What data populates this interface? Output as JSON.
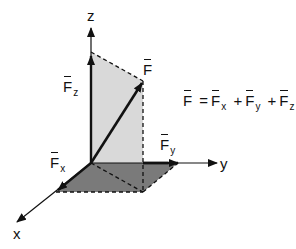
{
  "diagram": {
    "axes": {
      "x": "x",
      "y": "y",
      "z": "z"
    },
    "vectors": {
      "F": {
        "symbol": "F",
        "subscript": ""
      },
      "Fx": {
        "symbol": "F",
        "subscript": "x"
      },
      "Fy": {
        "symbol": "F",
        "subscript": "y"
      },
      "Fz": {
        "symbol": "F",
        "subscript": "z"
      }
    },
    "equation": {
      "lhs": "F",
      "equals": "=",
      "terms": [
        {
          "symbol": "F",
          "subscript": "x"
        },
        {
          "symbol": "F",
          "subscript": "y"
        },
        {
          "symbol": "F",
          "subscript": "z"
        }
      ],
      "plus": "+"
    },
    "colors": {
      "line": "#111111",
      "vertical_plane": "#d9d9d9",
      "ground_plane": "#7a7a7a",
      "background": "#ffffff"
    }
  }
}
